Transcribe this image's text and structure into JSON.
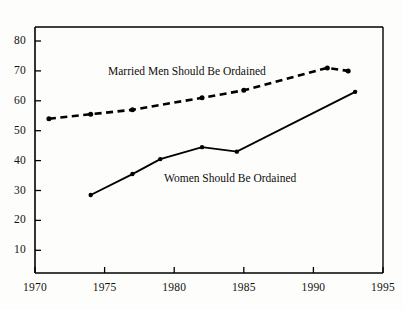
{
  "chart_data": {
    "type": "line",
    "title": "",
    "subtitle": "",
    "xlabel": "",
    "ylabel": "",
    "xlim": [
      1970,
      1995
    ],
    "ylim": [
      0,
      85
    ],
    "grid": false,
    "legend_position": "inline-annotations",
    "x_ticks": [
      1970,
      1975,
      1980,
      1985,
      1990,
      1995
    ],
    "x_tick_labels": [
      "1970",
      "1975",
      "1980",
      "1985",
      "1990",
      "1995"
    ],
    "y_ticks": [
      10,
      20,
      30,
      40,
      50,
      60,
      70,
      80
    ],
    "y_tick_labels": [
      "10",
      "20",
      "30",
      "40",
      "50",
      "60",
      "70",
      "80"
    ],
    "series": [
      {
        "name": "Married Men Should Be Ordained",
        "style": "dashed",
        "color": "#000000",
        "marker": "circle",
        "x": [
          1971,
          1974,
          1977,
          1982,
          1985,
          1991,
          1992.5
        ],
        "values": [
          54,
          55.5,
          57,
          61,
          63.5,
          71,
          70
        ]
      },
      {
        "name": "Women Should Be Ordained",
        "style": "solid",
        "color": "#000000",
        "marker": "circle",
        "x": [
          1974,
          1977,
          1979,
          1982,
          1984.5,
          1993
        ],
        "values": [
          28.5,
          35.5,
          40.5,
          44.5,
          43,
          63
        ]
      }
    ],
    "annotations": [
      {
        "text": "Married Men Should Be Ordained",
        "x_px": 108,
        "y_px": 65
      },
      {
        "text": "Women Should Be Ordained",
        "x_px": 164,
        "y_px": 172
      }
    ]
  },
  "axes": {
    "frame_color": "#000000",
    "tick_color": "#000000"
  }
}
